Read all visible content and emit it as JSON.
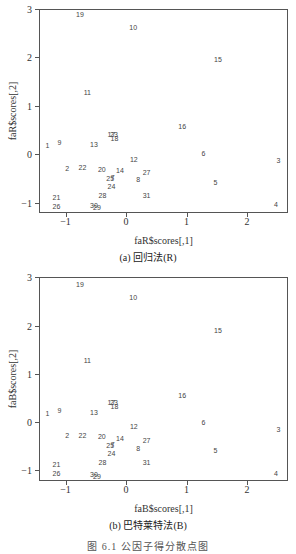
{
  "figure_caption": "图 6.1   公因子得分散点图",
  "chart_data": [
    {
      "type": "scatter",
      "title": "(a) 回归法(R)",
      "xlabel": "faR$scores[,1]",
      "ylabel": "faR$scores[,2]",
      "xlim": [
        -1.45,
        2.65
      ],
      "ylim": [
        -1.2,
        3.0
      ],
      "xticks": [
        -1,
        0,
        1,
        2
      ],
      "yticks": [
        -1,
        0,
        1,
        2,
        3
      ],
      "grid": false,
      "points": [
        {
          "label": "1",
          "x": -1.3,
          "y": 0.18
        },
        {
          "label": "2",
          "x": -0.97,
          "y": -0.28
        },
        {
          "label": "3",
          "x": 2.52,
          "y": -0.13
        },
        {
          "label": "4",
          "x": 2.48,
          "y": -1.03
        },
        {
          "label": "5",
          "x": 1.48,
          "y": -0.57
        },
        {
          "label": "6",
          "x": 1.28,
          "y": 0.02
        },
        {
          "label": "7",
          "x": -0.22,
          "y": -0.47
        },
        {
          "label": "8",
          "x": 0.2,
          "y": -0.52
        },
        {
          "label": "9",
          "x": -1.1,
          "y": 0.25
        },
        {
          "label": "10",
          "x": 0.12,
          "y": 2.62
        },
        {
          "label": "11",
          "x": -0.64,
          "y": 1.27
        },
        {
          "label": "12",
          "x": 0.13,
          "y": -0.1
        },
        {
          "label": "13",
          "x": -0.53,
          "y": 0.2
        },
        {
          "label": "14",
          "x": -0.1,
          "y": -0.34
        },
        {
          "label": "15",
          "x": 1.52,
          "y": 1.95
        },
        {
          "label": "16",
          "x": 0.93,
          "y": 0.58
        },
        {
          "label": "17",
          "x": -0.24,
          "y": 0.42
        },
        {
          "label": "18",
          "x": -0.19,
          "y": 0.34
        },
        {
          "label": "19",
          "x": -0.76,
          "y": 2.88
        },
        {
          "label": "20",
          "x": -0.4,
          "y": -0.31
        },
        {
          "label": "21",
          "x": -1.15,
          "y": -0.89
        },
        {
          "label": "22",
          "x": -0.72,
          "y": -0.27
        },
        {
          "label": "23",
          "x": -0.2,
          "y": 0.42
        },
        {
          "label": "24",
          "x": -0.24,
          "y": -0.66
        },
        {
          "label": "25",
          "x": -0.26,
          "y": -0.49
        },
        {
          "label": "26",
          "x": -1.15,
          "y": -1.07
        },
        {
          "label": "27",
          "x": 0.34,
          "y": -0.38
        },
        {
          "label": "28",
          "x": -0.39,
          "y": -0.85
        },
        {
          "label": "29",
          "x": -0.48,
          "y": -1.1
        },
        {
          "label": "30",
          "x": -0.53,
          "y": -1.05
        },
        {
          "label": "31",
          "x": 0.34,
          "y": -0.84
        }
      ]
    },
    {
      "type": "scatter",
      "title": "(b) 巴特莱特法(B)",
      "xlabel": "faB$scores[,1]",
      "ylabel": "faB$scores[,2]",
      "xlim": [
        -1.45,
        2.65
      ],
      "ylim": [
        -1.25,
        3.0
      ],
      "xticks": [
        -1,
        0,
        1,
        2
      ],
      "yticks": [
        -1,
        0,
        1,
        2,
        3
      ],
      "grid": false,
      "points": [
        {
          "label": "1",
          "x": -1.3,
          "y": 0.18
        },
        {
          "label": "2",
          "x": -0.97,
          "y": -0.28
        },
        {
          "label": "3",
          "x": 2.52,
          "y": -0.15
        },
        {
          "label": "4",
          "x": 2.48,
          "y": -1.05
        },
        {
          "label": "5",
          "x": 1.48,
          "y": -0.59
        },
        {
          "label": "6",
          "x": 1.28,
          "y": 0.01
        },
        {
          "label": "7",
          "x": -0.22,
          "y": -0.45
        },
        {
          "label": "8",
          "x": 0.2,
          "y": -0.54
        },
        {
          "label": "9",
          "x": -1.1,
          "y": 0.24
        },
        {
          "label": "10",
          "x": 0.12,
          "y": 2.6
        },
        {
          "label": "11",
          "x": -0.64,
          "y": 1.28
        },
        {
          "label": "12",
          "x": 0.13,
          "y": -0.09
        },
        {
          "label": "13",
          "x": -0.53,
          "y": 0.2
        },
        {
          "label": "14",
          "x": -0.1,
          "y": -0.33
        },
        {
          "label": "15",
          "x": 1.52,
          "y": 1.9
        },
        {
          "label": "16",
          "x": 0.93,
          "y": 0.57
        },
        {
          "label": "17",
          "x": -0.24,
          "y": 0.42
        },
        {
          "label": "18",
          "x": -0.19,
          "y": 0.34
        },
        {
          "label": "19",
          "x": -0.76,
          "y": 2.87
        },
        {
          "label": "20",
          "x": -0.4,
          "y": -0.3
        },
        {
          "label": "21",
          "x": -1.15,
          "y": -0.88
        },
        {
          "label": "22",
          "x": -0.72,
          "y": -0.26
        },
        {
          "label": "23",
          "x": -0.2,
          "y": 0.42
        },
        {
          "label": "24",
          "x": -0.24,
          "y": -0.65
        },
        {
          "label": "25",
          "x": -0.26,
          "y": -0.48
        },
        {
          "label": "26",
          "x": -1.15,
          "y": -1.06
        },
        {
          "label": "27",
          "x": 0.34,
          "y": -0.37
        },
        {
          "label": "28",
          "x": -0.39,
          "y": -0.83
        },
        {
          "label": "29",
          "x": -0.48,
          "y": -1.12
        },
        {
          "label": "30",
          "x": -0.53,
          "y": -1.07
        },
        {
          "label": "31",
          "x": 0.34,
          "y": -0.83
        }
      ]
    }
  ]
}
